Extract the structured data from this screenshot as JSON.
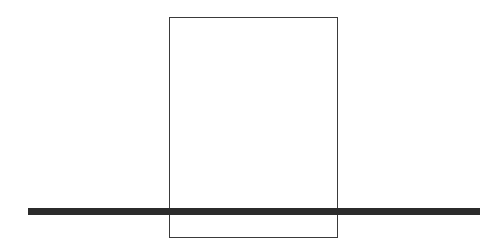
{
  "diagram": {
    "shapes": [
      {
        "type": "rectangle",
        "style": "outline",
        "stroke": "#3a3a3a",
        "fill": "none"
      },
      {
        "type": "horizontal-bar",
        "style": "filled",
        "fill": "#2b2b2b"
      }
    ]
  }
}
